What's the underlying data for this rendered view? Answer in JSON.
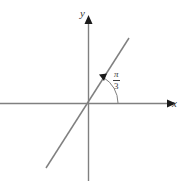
{
  "figure": {
    "background_color": "#ffffff",
    "stroke_color": "#808080",
    "text_color": "#3a3a3a"
  },
  "axes": {
    "x_label": "x",
    "y_label": "y",
    "x_axis": {
      "x1": 0,
      "y1": 103,
      "x2": 170,
      "y2": 103,
      "arrow": "right"
    },
    "y_axis": {
      "x1": 88,
      "y1": 180,
      "x2": 88,
      "y2": 21,
      "arrow": "up"
    }
  },
  "line": {
    "name": "terminal-ray",
    "x1": 46,
    "y1": 168,
    "x2": 129,
    "y2": 38,
    "slope_description": "positive slope through origin"
  },
  "angle": {
    "label_numerator": "π",
    "label_denominator": "3",
    "value_text": "π/3",
    "arc_radius": 30,
    "arc_start_deg": 0,
    "arc_end_deg": 60,
    "arrow": "counterclockwise"
  },
  "origin": {
    "x": 88,
    "y": 103
  }
}
